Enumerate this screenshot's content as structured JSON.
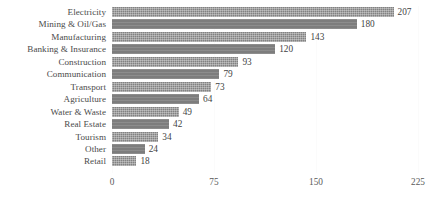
{
  "chart_data": {
    "type": "bar",
    "orientation": "horizontal",
    "title": "",
    "subtitle": "",
    "xlabel": "",
    "ylabel": "",
    "xlim": [
      0,
      225
    ],
    "xticks": [
      0,
      75,
      150,
      225
    ],
    "xtick_labels": [
      "0",
      "75",
      "150",
      "225"
    ],
    "grid": true,
    "grid_axis": "x",
    "legend": false,
    "legend_position": "none",
    "data_labels": true,
    "bar_color": "#828282",
    "categories": [
      "Electricity",
      "Mining & Oil/Gas",
      "Manufacturing",
      "Banking & Insurance",
      "Construction",
      "Communication",
      "Transport",
      "Agriculture",
      "Water & Waste",
      "Real Estate",
      "Tourism",
      "Other",
      "Retail"
    ],
    "values": [
      207,
      180,
      143,
      120,
      93,
      79,
      73,
      64,
      49,
      42,
      34,
      24,
      18
    ],
    "value_labels": [
      "207",
      "180",
      "143",
      "120",
      "93",
      "79",
      "73",
      "64",
      "49",
      "42",
      "34",
      "24",
      "18"
    ]
  }
}
